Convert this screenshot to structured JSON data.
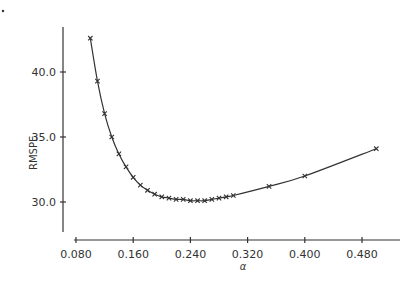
{
  "chart_data": {
    "type": "line",
    "title": "",
    "xlabel": "α",
    "ylabel": "RMSPE",
    "xlim": [
      0.08,
      0.52
    ],
    "ylim": [
      27.0,
      44.5
    ],
    "xticks": [
      "0.080",
      "0.160",
      "0.240",
      "0.320",
      "0.400",
      "0.480"
    ],
    "yticks": [
      "30.0",
      "35.0",
      "40.0"
    ],
    "grid": false,
    "legend": null,
    "marker": "x",
    "x": [
      0.1,
      0.11,
      0.12,
      0.13,
      0.14,
      0.15,
      0.16,
      0.17,
      0.18,
      0.19,
      0.2,
      0.21,
      0.22,
      0.23,
      0.24,
      0.25,
      0.26,
      0.27,
      0.28,
      0.29,
      0.3,
      0.35,
      0.4,
      0.5
    ],
    "series": [
      {
        "name": "RMSPE",
        "values": [
          42.6,
          39.3,
          36.8,
          35.0,
          33.7,
          32.7,
          31.9,
          31.3,
          30.9,
          30.6,
          30.4,
          30.3,
          30.2,
          30.2,
          30.1,
          30.1,
          30.1,
          30.2,
          30.3,
          30.4,
          30.5,
          31.2,
          32.0,
          34.1
        ]
      }
    ]
  }
}
